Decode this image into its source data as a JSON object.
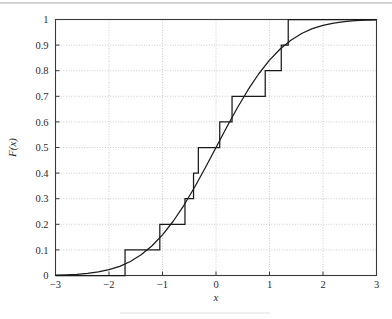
{
  "chart_data": {
    "type": "line",
    "title": "",
    "subtitle": "",
    "xlabel": "x",
    "ylabel": "F(x)",
    "xlim": [
      -3,
      3
    ],
    "ylim": [
      0,
      1
    ],
    "grid": true,
    "legend_position": "none",
    "xticks": [
      -3,
      -2,
      -1,
      0,
      1,
      2,
      3
    ],
    "xticklabels": [
      "−3",
      "−2",
      "−1",
      "0",
      "1",
      "2",
      "3"
    ],
    "yticks": [
      0,
      0.1,
      0.2,
      0.3,
      0.4,
      0.5,
      0.6,
      0.7,
      0.8,
      0.9,
      1
    ],
    "yticklabels": [
      "0",
      "0.1",
      "0.2",
      "0.3",
      "0.4",
      "0.5",
      "0.6",
      "0.7",
      "0.8",
      "0.9",
      "1"
    ],
    "series": [
      {
        "name": "theoretical-normal-cdf",
        "type": "line",
        "style": "solid",
        "color": "#1a1a1a",
        "x": [
          -3.0,
          -2.8,
          -2.6,
          -2.4,
          -2.2,
          -2.0,
          -1.8,
          -1.6,
          -1.4,
          -1.2,
          -1.0,
          -0.8,
          -0.6,
          -0.4,
          -0.2,
          0.0,
          0.2,
          0.4,
          0.6,
          0.8,
          1.0,
          1.2,
          1.4,
          1.6,
          1.8,
          2.0,
          2.2,
          2.4,
          2.6,
          2.8,
          3.0
        ],
        "values": [
          0.0013,
          0.0026,
          0.0047,
          0.0082,
          0.0139,
          0.0228,
          0.0359,
          0.0548,
          0.0808,
          0.1151,
          0.1587,
          0.2119,
          0.2743,
          0.3446,
          0.4207,
          0.5,
          0.5793,
          0.6554,
          0.7257,
          0.7881,
          0.8413,
          0.8849,
          0.9192,
          0.9452,
          0.9641,
          0.9772,
          0.9861,
          0.9918,
          0.9953,
          0.9974,
          0.9987
        ]
      },
      {
        "name": "empirical-cdf-step",
        "type": "step",
        "style": "solid",
        "color": "#1a1a1a",
        "jump_x": [
          -1.7,
          -1.05,
          -0.58,
          -0.42,
          -0.33,
          0.07,
          0.3,
          0.92,
          1.22,
          1.35
        ],
        "jump_to": [
          0.1,
          0.2,
          0.3,
          0.4,
          0.5,
          0.6,
          0.7,
          0.8,
          0.9,
          1.0
        ],
        "step_size": 0.1,
        "n_samples": 10
      }
    ]
  },
  "figure": {
    "background_color": "#ffffff",
    "axis_color": "#3a3a3a",
    "grid_color": "#bfbfbf",
    "curve_color": "#1a1a1a"
  }
}
